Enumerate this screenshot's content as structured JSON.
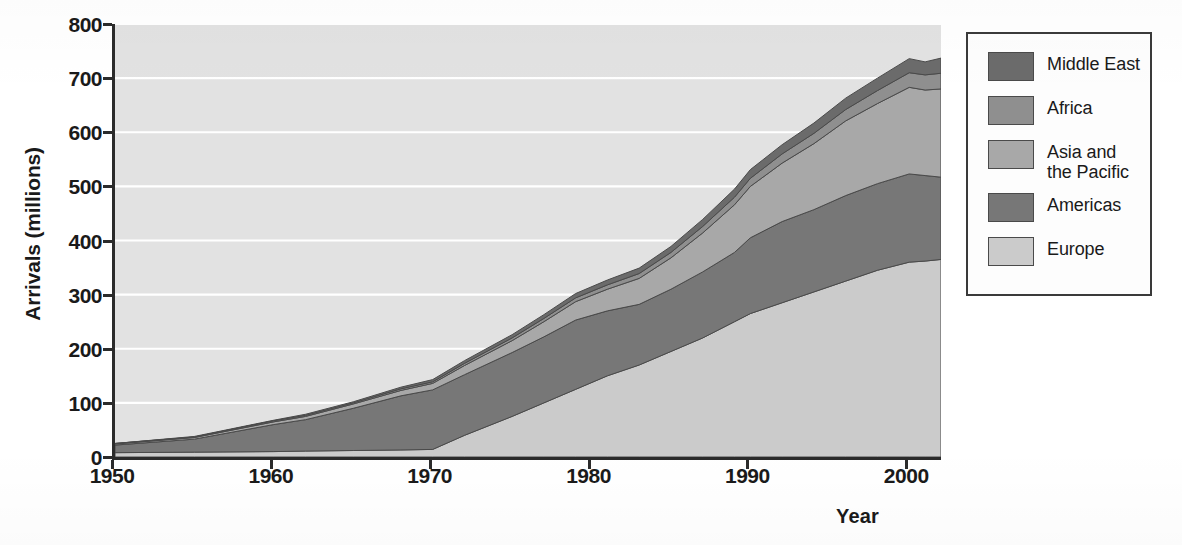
{
  "chart_data": {
    "type": "area",
    "title": "",
    "subtitle": "",
    "xlabel": "Year",
    "ylabel": "Arrivals (millions)",
    "stacked": true,
    "grid": true,
    "grid_color": "#ffffff",
    "plot_background": "#e2e2e2",
    "legend_position": "right",
    "xlim": [
      1950,
      2002
    ],
    "ylim": [
      0,
      800
    ],
    "xticks": [
      1950,
      1960,
      1970,
      1980,
      1990,
      2000
    ],
    "yticks": [
      0,
      100,
      200,
      300,
      400,
      500,
      600,
      700,
      800
    ],
    "xtick_labels": [
      "1950",
      "1960",
      "1970",
      "1980",
      "1990",
      "2000"
    ],
    "ytick_labels": [
      "0",
      "100",
      "200",
      "300",
      "400",
      "500",
      "600",
      "700",
      "800"
    ],
    "x": [
      1950,
      1955,
      1960,
      1962,
      1965,
      1968,
      1970,
      1972,
      1975,
      1977,
      1979,
      1981,
      1983,
      1985,
      1987,
      1989,
      1990,
      1992,
      1994,
      1996,
      1998,
      2000,
      2001,
      2002
    ],
    "stack_order_bottom_to_top": [
      "Europe",
      "Americas",
      "Asia and the Pacific",
      "Africa",
      "Middle East"
    ],
    "series": [
      {
        "name": "Europe",
        "color": "#cbcbcb",
        "values": [
          8,
          9,
          10,
          11,
          12,
          13,
          14,
          40,
          75,
          100,
          125,
          150,
          170,
          195,
          220,
          250,
          265,
          285,
          305,
          325,
          345,
          360,
          362,
          365
        ]
      },
      {
        "name": "Americas",
        "color": "#777777",
        "values": [
          14,
          24,
          50,
          58,
          78,
          100,
          110,
          112,
          118,
          122,
          128,
          120,
          112,
          115,
          122,
          128,
          140,
          150,
          152,
          158,
          160,
          163,
          158,
          152
        ]
      },
      {
        "name": "Asia and the Pacific",
        "color": "#a8a8a8",
        "values": [
          2,
          3,
          5,
          6,
          8,
          10,
          12,
          17,
          22,
          28,
          34,
          40,
          48,
          58,
          72,
          88,
          95,
          108,
          122,
          138,
          148,
          160,
          158,
          163
        ]
      },
      {
        "name": "Africa",
        "color": "#8f8f8f",
        "values": [
          1,
          1,
          2,
          2,
          2,
          3,
          3,
          4,
          5,
          6,
          7,
          8,
          9,
          10,
          12,
          14,
          15,
          17,
          19,
          21,
          24,
          27,
          28,
          29
        ]
      },
      {
        "name": "Middle East",
        "color": "#6b6b6b"
      }
    ],
    "middle_east_values": [
      0,
      1,
      1,
      2,
      2,
      3,
      4,
      5,
      6,
      7,
      8,
      9,
      10,
      11,
      13,
      15,
      16,
      17,
      19,
      21,
      23,
      26,
      24,
      28
    ],
    "totals": [
      25,
      38,
      68,
      79,
      102,
      129,
      143,
      178,
      226,
      263,
      302,
      327,
      349,
      389,
      439,
      495,
      531,
      577,
      617,
      663,
      700,
      736,
      730,
      737
    ],
    "annotations": []
  },
  "axes": {
    "y_title": "Arrivals (millions)",
    "x_title": "Year"
  },
  "legend": {
    "items": [
      {
        "label": "Middle East",
        "label_line2": "",
        "color": "#6b6b6b"
      },
      {
        "label": "Africa",
        "label_line2": "",
        "color": "#8f8f8f"
      },
      {
        "label": "Asia and",
        "label_line2": "the Pacific",
        "color": "#a8a8a8"
      },
      {
        "label": "Americas",
        "label_line2": "",
        "color": "#777777"
      },
      {
        "label": "Europe",
        "label_line2": "",
        "color": "#cbcbcb"
      }
    ]
  }
}
